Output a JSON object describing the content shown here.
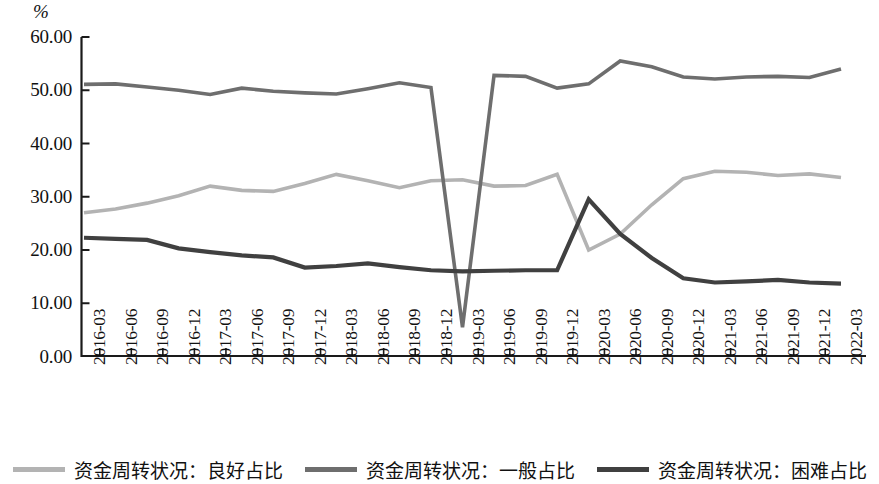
{
  "chart_data": {
    "type": "line",
    "title": "",
    "subtitle": "",
    "xlabel": "",
    "ylabel": "%",
    "ylim": [
      0,
      60
    ],
    "ytick_labels": [
      "0.00",
      "10.00",
      "20.00",
      "30.00",
      "40.00",
      "50.00",
      "60.00"
    ],
    "ytick_values": [
      0,
      10,
      20,
      30,
      40,
      50,
      60
    ],
    "grid": false,
    "legend_position": "bottom",
    "categories": [
      "2016-03",
      "2016-06",
      "2016-09",
      "2016-12",
      "2017-03",
      "2017-06",
      "2017-09",
      "2017-12",
      "2018-03",
      "2018-06",
      "2018-09",
      "2018-12",
      "2019-03",
      "2019-06",
      "2019-09",
      "2019-12",
      "2020-03",
      "2020-06",
      "2020-09",
      "2020-12",
      "2021-03",
      "2021-06",
      "2021-09",
      "2021-12",
      "2022-03"
    ],
    "series": [
      {
        "name": "资金周转状况：良好占比",
        "color": "#b3b3b3",
        "values": [
          27.0,
          27.7,
          28.8,
          30.2,
          32.0,
          31.2,
          31.0,
          32.5,
          34.2,
          33.0,
          31.7,
          33.0,
          33.2,
          32.0,
          32.1,
          34.2,
          20.0,
          23.0,
          28.5,
          33.4,
          34.8,
          34.6,
          34.0,
          34.3,
          33.6
        ]
      },
      {
        "name": "资金周转状况：一般占比",
        "color": "#6e6e6e",
        "values": [
          51.1,
          51.2,
          50.6,
          50.0,
          49.2,
          50.4,
          49.8,
          49.5,
          49.3,
          50.3,
          51.4,
          50.5,
          5.5,
          52.8,
          52.6,
          50.4,
          51.2,
          55.5,
          54.4,
          52.5,
          52.1,
          52.5,
          52.6,
          52.4,
          54.0
        ]
      },
      {
        "name": "资金周转状况：困难占比",
        "color": "#404040",
        "values": [
          22.3,
          22.1,
          21.9,
          20.3,
          19.6,
          19.0,
          18.6,
          16.7,
          17.0,
          17.5,
          16.8,
          16.2,
          16.0,
          16.1,
          16.2,
          16.2,
          29.5,
          23.0,
          18.5,
          14.7,
          13.9,
          14.1,
          14.4,
          13.9,
          13.7
        ]
      }
    ]
  },
  "axis": {
    "unit_label": "%"
  },
  "legend": {
    "items": [
      {
        "label": "资金周转状况：良好占比",
        "color": "#b3b3b3"
      },
      {
        "label": "资金周转状况：一般占比",
        "color": "#6e6e6e"
      },
      {
        "label": "资金周转状况：困难占比",
        "color": "#404040"
      }
    ]
  }
}
